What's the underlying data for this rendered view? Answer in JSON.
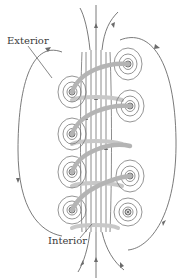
{
  "figure": {
    "labels": {
      "exterior": "Exterior",
      "interior": "Interior"
    },
    "colors": {
      "field_line": "#6b6b6b",
      "coil": "#b4b4b4",
      "background": "#ffffff",
      "text": "#3a3a3a"
    },
    "turns": 4
  }
}
